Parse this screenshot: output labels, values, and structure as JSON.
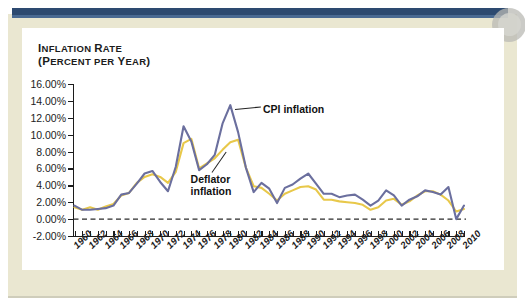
{
  "figure": {
    "y_axis_title_line1": "Inflation Rate",
    "y_axis_title_line2": "(Percent per Year)",
    "colors": {
      "cpi_line": "#6b6f9e",
      "deflator_line": "#e8c84a",
      "navy_bar": "#2d4a70",
      "page_cream": "#eae7d1",
      "plot_background": "#ffffff",
      "axis": "#1c1c1c"
    }
  },
  "annotations": {
    "cpi": "CPI inflation",
    "deflator_line1": "Deflator",
    "deflator_line2": "inflation"
  },
  "chart_data": {
    "type": "line",
    "title": "",
    "xlabel": "",
    "ylabel": "Inflation Rate (Percent per Year)",
    "ylim": [
      -2,
      16
    ],
    "xlim": [
      1960,
      2010
    ],
    "grid": false,
    "legend": "annotated-inline",
    "y_ticks": [
      16,
      14,
      12,
      10,
      8,
      6,
      4,
      2,
      0,
      -2
    ],
    "y_tick_labels": [
      "16.00%",
      "14.00%",
      "12.00%",
      "10.00%",
      "8.00%",
      "6.00%",
      "4.00%",
      "2.00%",
      "0.00%",
      "-2.00%"
    ],
    "x_tick_labels": [
      "1960",
      "1962",
      "1964",
      "1966",
      "1968",
      "1970",
      "1972",
      "1974",
      "1976",
      "1978",
      "1980",
      "1982",
      "1984",
      "1986",
      "1988",
      "1990",
      "1992",
      "1994",
      "1996",
      "1998",
      "2000",
      "2002",
      "2004",
      "2006",
      "2008",
      "2010"
    ],
    "x_tick_step": 2,
    "x_minor_tick_step": 1,
    "zero_reference_line": 0,
    "x": [
      1960,
      1961,
      1962,
      1963,
      1964,
      1965,
      1966,
      1967,
      1968,
      1969,
      1970,
      1971,
      1972,
      1973,
      1974,
      1975,
      1976,
      1977,
      1978,
      1979,
      1980,
      1981,
      1982,
      1983,
      1984,
      1985,
      1986,
      1987,
      1988,
      1989,
      1990,
      1991,
      1992,
      1993,
      1994,
      1995,
      1996,
      1997,
      1998,
      1999,
      2000,
      2001,
      2002,
      2003,
      2004,
      2005,
      2006,
      2007,
      2008,
      2009,
      2010
    ],
    "series": [
      {
        "name": "CPI inflation",
        "color": "#6b6f9e",
        "values": [
          1.6,
          1.1,
          1.1,
          1.2,
          1.3,
          1.6,
          2.9,
          3.1,
          4.2,
          5.4,
          5.7,
          4.4,
          3.3,
          6.2,
          11.0,
          9.2,
          5.8,
          6.5,
          7.6,
          11.3,
          13.5,
          10.3,
          6.1,
          3.2,
          4.3,
          3.6,
          1.9,
          3.7,
          4.1,
          4.8,
          5.4,
          4.2,
          3.0,
          3.0,
          2.6,
          2.8,
          2.9,
          2.3,
          1.6,
          2.2,
          3.4,
          2.8,
          1.6,
          2.3,
          2.7,
          3.4,
          3.2,
          2.9,
          3.8,
          0.0,
          1.6
        ]
      },
      {
        "name": "Deflator inflation",
        "color": "#e8c84a",
        "values": [
          1.4,
          1.1,
          1.4,
          1.1,
          1.5,
          1.8,
          2.8,
          3.1,
          4.3,
          5.0,
          5.3,
          5.0,
          4.3,
          5.6,
          9.0,
          9.5,
          6.0,
          6.6,
          7.2,
          8.2,
          9.1,
          9.4,
          6.1,
          3.9,
          3.7,
          3.0,
          2.2,
          3.0,
          3.4,
          3.8,
          3.9,
          3.5,
          2.3,
          2.3,
          2.1,
          2.0,
          1.9,
          1.7,
          1.1,
          1.4,
          2.2,
          2.4,
          1.7,
          2.1,
          2.8,
          3.3,
          3.3,
          2.9,
          2.2,
          0.9,
          1.2
        ]
      }
    ]
  }
}
